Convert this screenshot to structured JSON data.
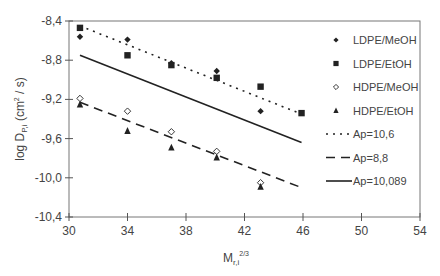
{
  "chart_data": {
    "type": "scatter",
    "title": "",
    "xlabel": "M_r,i^(2/3)",
    "xlabel_main": "M",
    "xlabel_sub": "r,i",
    "xlabel_sup": "2/3",
    "ylabel": "log D_P,i (cm² / s)",
    "ylabel_main": "log D",
    "ylabel_sub": "P,i",
    "ylabel_unit_pre": "(cm",
    "ylabel_unit_sup": "2",
    "ylabel_unit_post": " / s)",
    "xlim": [
      30,
      54
    ],
    "ylim": [
      -10.4,
      -8.4
    ],
    "xticks": [
      30,
      34,
      38,
      42,
      46,
      50,
      54
    ],
    "xtick_labels": [
      "30",
      "34",
      "38",
      "42",
      "46",
      "50",
      "54"
    ],
    "yticks": [
      -8.4,
      -8.8,
      -9.2,
      -9.6,
      -10.0,
      -10.4
    ],
    "ytick_labels": [
      "-8,4",
      "-8,8",
      "-9,2",
      "-9,6",
      "-10,0",
      "-10,4"
    ],
    "grid": false,
    "legend_position": "right",
    "series": [
      {
        "name": "LDPE/MeOH",
        "marker": "filled-diamond",
        "x": [
          30.75,
          34.0,
          37.0,
          40.1,
          43.1
        ],
        "y": [
          -8.56,
          -8.59,
          -8.83,
          -8.91,
          -9.32
        ]
      },
      {
        "name": "LDPE/EtOH",
        "marker": "filled-square",
        "x": [
          30.75,
          34.0,
          37.0,
          40.1,
          43.1,
          45.9
        ],
        "y": [
          -8.47,
          -8.75,
          -8.85,
          -8.98,
          -9.07,
          -9.34
        ]
      },
      {
        "name": "HDPE/MeOH",
        "marker": "open-diamond",
        "x": [
          30.75,
          34.0,
          37.0,
          40.1,
          43.1
        ],
        "y": [
          -9.19,
          -9.32,
          -9.53,
          -9.73,
          -10.05
        ]
      },
      {
        "name": "HDPE/EtOH",
        "marker": "filled-triangle",
        "x": [
          30.75,
          34.0,
          37.0,
          40.1,
          43.1
        ],
        "y": [
          -9.25,
          -9.52,
          -9.69,
          -9.79,
          -10.09
        ]
      }
    ],
    "lines": [
      {
        "name": "Ap=10,6",
        "style": "dotted",
        "x": [
          30.75,
          45.9
        ],
        "y": [
          -8.45,
          -9.35
        ]
      },
      {
        "name": "Ap=8,8",
        "style": "dashed",
        "x": [
          30.75,
          45.9
        ],
        "y": [
          -9.23,
          -10.1
        ]
      },
      {
        "name": "Ap=10,089",
        "style": "solid",
        "x": [
          30.75,
          45.9
        ],
        "y": [
          -8.75,
          -9.64
        ]
      }
    ]
  },
  "colors": {
    "axis": "#555555",
    "series": "#222222",
    "text": "#444444"
  }
}
